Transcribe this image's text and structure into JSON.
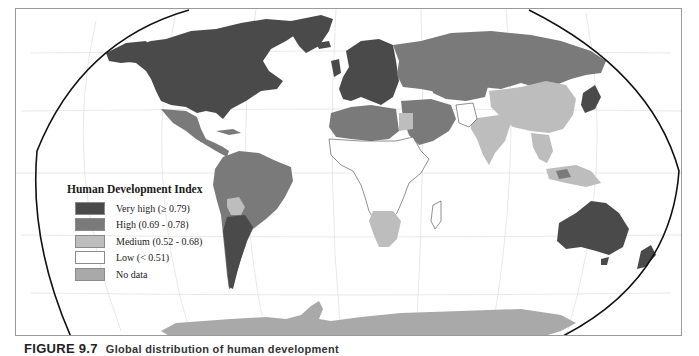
{
  "map": {
    "title": "Human Development Index world map",
    "projection": "Robinson",
    "colors": {
      "very_high": "#4a4a4a",
      "high": "#7a7a7a",
      "medium": "#bdbdbd",
      "low": "#ffffff",
      "no_data": "#a9a9a9",
      "graticule": "#dedede",
      "outline": "#111111"
    }
  },
  "legend": {
    "title": "Human Development Index",
    "items": [
      {
        "label": "Very high (≥ 0.79)",
        "color": "#4a4a4a"
      },
      {
        "label": "High (0.69 - 0.78)",
        "color": "#7a7a7a"
      },
      {
        "label": "Medium (0.52 - 0.68)",
        "color": "#bdbdbd"
      },
      {
        "label": "Low (< 0.51)",
        "color": "#ffffff"
      },
      {
        "label": "No data",
        "color": "#a9a9a9"
      }
    ]
  },
  "caption": {
    "label": "FIGURE 9.7",
    "text": "Global distribution of human development"
  }
}
